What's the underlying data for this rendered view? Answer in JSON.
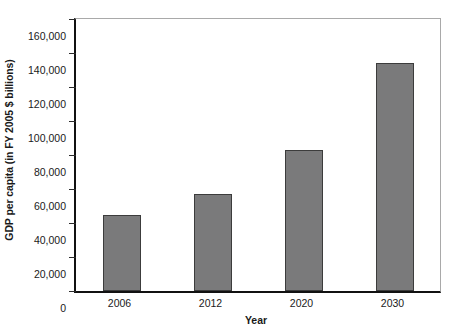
{
  "chart_data": {
    "type": "bar",
    "title": "",
    "subtitle": "",
    "xlabel": "Year",
    "ylabel": "GDP per capita (in FY 2005 $ billions)",
    "categories": [
      "2006",
      "2012",
      "2020",
      "2030"
    ],
    "values": [
      44500,
      57000,
      83000,
      134000
    ],
    "series": [
      {
        "name": "GDP per capita",
        "values": [
          44500,
          57000,
          83000,
          134000
        ]
      }
    ],
    "ylim": [
      0,
      160000
    ],
    "ytick_values": [
      0,
      20000,
      40000,
      60000,
      80000,
      100000,
      120000,
      140000,
      160000
    ],
    "ytick_labels": [
      "0",
      "20,000",
      "40,000",
      "60,000",
      "80,000",
      "100,000",
      "120,000",
      "140,000",
      "160,000"
    ],
    "xtick_labels": [
      "2006",
      "2012",
      "2020",
      "2030"
    ],
    "grid": false,
    "legend": null,
    "legend_position": "none",
    "annotations": [],
    "colors": {
      "bar_fill": "#7a7a7b",
      "bar_stroke": "#3c3c3c",
      "axis": "#111111",
      "frame": "#a9a9a9",
      "text": "#1a1a1a",
      "background": "#ffffff"
    }
  }
}
